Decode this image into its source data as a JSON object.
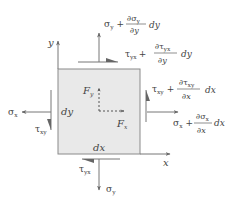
{
  "diagram": {
    "type": "free-body stress element",
    "colors": {
      "element_fill": "#e9e9e9",
      "element_border": "#8a8a8a",
      "arrow": "#777777",
      "text": "#444444"
    },
    "axes": {
      "x_label": "x",
      "y_label": "y"
    },
    "element": {
      "width_label": "dx",
      "height_label": "dy"
    },
    "body_forces": {
      "fx": {
        "sym": "F",
        "sub": "x"
      },
      "fy": {
        "sym": "F",
        "sub": "y"
      }
    },
    "stresses": {
      "left_normal": {
        "sym": "σ",
        "sub": "x"
      },
      "left_shear": {
        "sym": "τ",
        "sub": "xy"
      },
      "bottom_normal": {
        "sym": "σ",
        "sub": "y"
      },
      "bottom_shear": {
        "sym": "τ",
        "sub": "yx"
      },
      "top_normal": {
        "base_sym": "σ",
        "base_sub": "y",
        "plus": "+",
        "num": "∂σ",
        "num_sub": "y",
        "den": "∂y",
        "diff": "dy"
      },
      "top_shear": {
        "base_sym": "τ",
        "base_sub": "yx",
        "plus": "+",
        "num": "∂τ",
        "num_sub": "yx",
        "den": "∂y",
        "diff": "dy"
      },
      "right_shear": {
        "base_sym": "τ",
        "base_sub": "xy",
        "plus": "+",
        "num": "∂τ",
        "num_sub": "xy",
        "den": "∂x",
        "diff": "dx"
      },
      "right_normal": {
        "base_sym": "σ",
        "base_sub": "x",
        "plus": "+",
        "num": "∂σ",
        "num_sub": "x",
        "den": "∂x",
        "diff": "dx"
      }
    }
  }
}
